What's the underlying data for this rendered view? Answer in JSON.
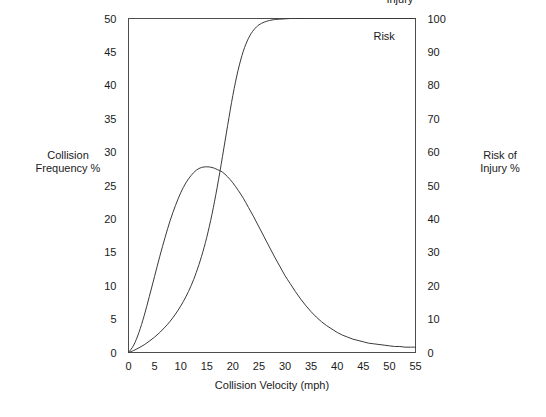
{
  "chart_data": {
    "type": "line",
    "title": "",
    "xlabel": "Collision Velocity (mph)",
    "ylabel": "Collision Frequency %",
    "y2label": "Risk of Injury %",
    "xlim": [
      0,
      55
    ],
    "ylim": [
      0,
      50
    ],
    "y2lim": [
      0,
      100
    ],
    "grid": false,
    "legend_position": "inline-annotation",
    "xticks": [
      0,
      5,
      10,
      15,
      20,
      25,
      30,
      35,
      40,
      45,
      50,
      55
    ],
    "xtick_labels": [
      "0",
      "5",
      "10",
      "15",
      "20",
      "25",
      "30",
      "35",
      "40",
      "45",
      "50",
      "55"
    ],
    "yticks": [
      0,
      5,
      10,
      15,
      20,
      25,
      30,
      35,
      40,
      45,
      50
    ],
    "ytick_labels": [
      "0",
      "5",
      "10",
      "15",
      "20",
      "25",
      "30",
      "35",
      "40",
      "45",
      "50"
    ],
    "y2ticks": [
      0,
      10,
      20,
      30,
      40,
      50,
      60,
      70,
      80,
      90,
      100
    ],
    "y2tick_labels": [
      "0",
      "10",
      "20",
      "30",
      "40",
      "50",
      "60",
      "70",
      "80",
      "90",
      "100"
    ],
    "annotations": [
      {
        "text": "Injury",
        "x": 52.0,
        "y_axis": "right",
        "y": 104.5
      },
      {
        "text": "Risk",
        "x": 49.0,
        "y_axis": "right",
        "y": 93.5
      }
    ],
    "series": [
      {
        "name": "Collision Frequency",
        "axis": "left",
        "units": "%",
        "x": [
          0,
          1,
          2,
          3,
          4,
          5,
          6,
          7,
          8,
          9,
          10,
          11,
          12,
          13,
          14,
          15,
          16,
          17,
          18,
          19,
          20,
          21,
          22,
          23,
          24,
          25,
          26,
          27,
          28,
          29,
          30,
          31,
          32,
          33,
          34,
          35,
          36,
          37,
          38,
          39,
          40,
          41,
          42,
          43,
          44,
          45,
          46,
          47,
          48,
          49,
          50,
          51,
          52,
          53,
          54,
          55
        ],
        "values": [
          0.0,
          1.1,
          3.0,
          5.5,
          8.4,
          11.4,
          14.4,
          17.2,
          19.8,
          22.0,
          23.9,
          25.4,
          26.5,
          27.3,
          27.7,
          27.8,
          27.7,
          27.4,
          27.0,
          26.3,
          25.4,
          24.3,
          23.1,
          21.7,
          20.3,
          18.8,
          17.3,
          15.8,
          14.3,
          12.9,
          11.5,
          10.3,
          9.1,
          8.0,
          7.0,
          6.1,
          5.3,
          4.6,
          4.0,
          3.5,
          3.0,
          2.6,
          2.3,
          2.0,
          1.8,
          1.6,
          1.4,
          1.3,
          1.2,
          1.1,
          1.0,
          0.9,
          0.9,
          0.8,
          0.8,
          0.8
        ]
      },
      {
        "name": "Injury Risk",
        "axis": "right",
        "units": "%",
        "x": [
          0,
          1,
          2,
          3,
          4,
          5,
          6,
          7,
          8,
          9,
          10,
          11,
          12,
          13,
          14,
          15,
          16,
          17,
          18,
          19,
          20,
          21,
          22,
          23,
          24,
          25,
          26,
          27,
          28,
          29,
          30,
          31,
          32,
          33,
          34,
          35,
          40,
          45,
          50,
          55
        ],
        "values": [
          0.0,
          0.6,
          1.4,
          2.3,
          3.4,
          4.6,
          6.0,
          7.6,
          9.4,
          11.5,
          13.9,
          16.7,
          20.0,
          24.0,
          28.8,
          34.5,
          41.4,
          49.5,
          58.6,
          68.0,
          77.0,
          84.5,
          90.2,
          94.1,
          96.6,
          98.1,
          98.9,
          99.4,
          99.7,
          99.8,
          99.9,
          100.0,
          100.0,
          100.0,
          100.0,
          100.0,
          100.0,
          100.0,
          100.0,
          100.0
        ]
      }
    ]
  },
  "axes": {
    "left_title_line1": "Collision",
    "left_title_line2": "Frequency %",
    "right_title_line1": "Risk of",
    "right_title_line2": "Injury %",
    "x_title": "Collision Velocity (mph)"
  },
  "colors": {
    "curve": "#3a3a3a",
    "frame": "#4d4d4d",
    "text": "#1a1a1a",
    "background": "#ffffff"
  }
}
